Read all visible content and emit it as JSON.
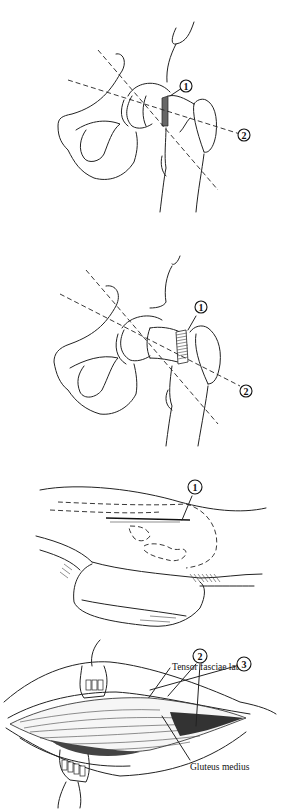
{
  "figure": {
    "panel_top": {
      "description": "Hip joint, anteroposterior view with screw placement (shaded region) and two dashed axis lines",
      "callouts": [
        {
          "id": "1",
          "label": "1"
        },
        {
          "id": "2",
          "label": "2"
        }
      ]
    },
    "panel_middle": {
      "description": "Hip joint with threaded screw at femoral neck and two dashed axis lines",
      "callouts": [
        {
          "id": "1",
          "label": "1"
        },
        {
          "id": "2",
          "label": "2"
        }
      ]
    },
    "panel_bottom": {
      "description": "Surgical exposure of lateral hip with retractors",
      "callouts": [
        {
          "id": "1",
          "label": "1"
        },
        {
          "id": "2",
          "label": "2"
        },
        {
          "id": "3",
          "label": "3"
        }
      ],
      "labels": {
        "tensor": "Tensor fasciae latae",
        "gluteus": "Gluteus medius"
      }
    }
  },
  "colors": {
    "line": "#222222",
    "background": "#ffffff"
  }
}
